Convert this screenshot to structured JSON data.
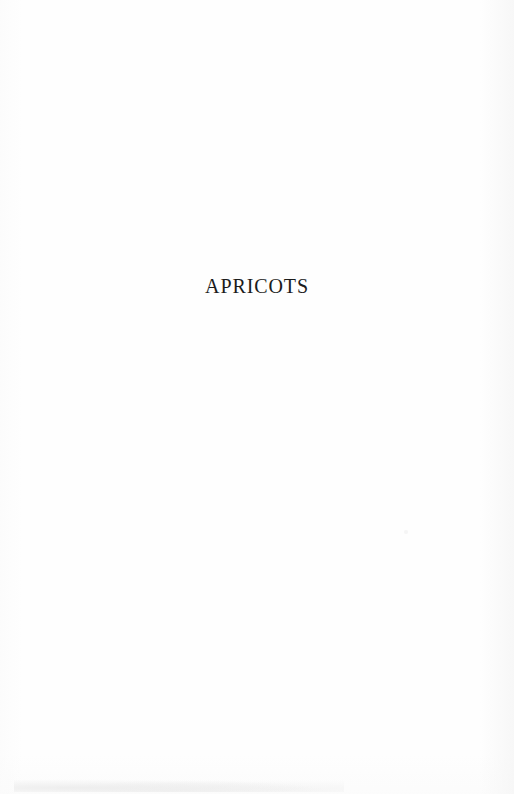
{
  "document": {
    "page_kind": "section-divider-page",
    "background_color": "#fefefe",
    "text_color": "#1b1b1b"
  },
  "body": {
    "section_title": "APRICOTS"
  }
}
